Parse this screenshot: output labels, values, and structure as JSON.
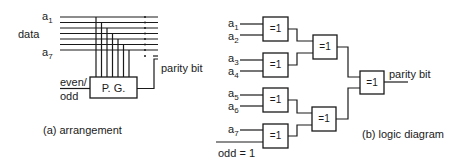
{
  "panel_a": {
    "caption": "(a) arrangement",
    "data_label": "data",
    "input_first": {
      "base": "a",
      "sub": "1"
    },
    "input_last": {
      "base": "a",
      "sub": "7"
    },
    "control_label_line1": "even/",
    "control_label_line2": "odd",
    "generator_label": "P. G.",
    "output_label": "parity bit",
    "data_line_count": 7
  },
  "panel_b": {
    "caption": "(b) logic diagram",
    "inputs": [
      {
        "base": "a",
        "sub": "1"
      },
      {
        "base": "a",
        "sub": "2"
      },
      {
        "base": "a",
        "sub": "3"
      },
      {
        "base": "a",
        "sub": "4"
      },
      {
        "base": "a",
        "sub": "5"
      },
      {
        "base": "a",
        "sub": "6"
      },
      {
        "base": "a",
        "sub": "7"
      }
    ],
    "odd_input_label": "odd = 1",
    "gate_label": "=1",
    "gates": [
      {
        "id": "xor-1",
        "label": "=1",
        "inputs": [
          "a1",
          "a2"
        ]
      },
      {
        "id": "xor-2",
        "label": "=1",
        "inputs": [
          "a3",
          "a4"
        ]
      },
      {
        "id": "xor-3",
        "label": "=1",
        "inputs": [
          "a5",
          "a6"
        ]
      },
      {
        "id": "xor-4",
        "label": "=1",
        "inputs": [
          "a7",
          "odd = 1"
        ]
      },
      {
        "id": "xor-5",
        "label": "=1",
        "inputs": [
          "xor-1",
          "xor-2"
        ]
      },
      {
        "id": "xor-6",
        "label": "=1",
        "inputs": [
          "xor-3",
          "xor-4"
        ]
      },
      {
        "id": "xor-7",
        "label": "=1",
        "inputs": [
          "xor-5",
          "xor-6"
        ]
      }
    ],
    "output_label": "parity bit"
  }
}
